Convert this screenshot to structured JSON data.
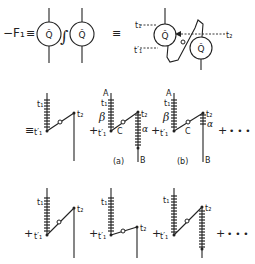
{
  "equation": {
    "lhs": "−F₁",
    "eq": "≡",
    "integral": "∫",
    "loop_symbol": "Q̂",
    "times": {
      "t1": "t₁",
      "t1p": "t′₁",
      "t2": "t₂"
    },
    "labels": {
      "A": "A",
      "B": "B",
      "C": "C",
      "alpha": "α",
      "beta": "β",
      "a": "(a)",
      "b": "(b)"
    },
    "plus": "+",
    "ellipsis": "• • •"
  }
}
